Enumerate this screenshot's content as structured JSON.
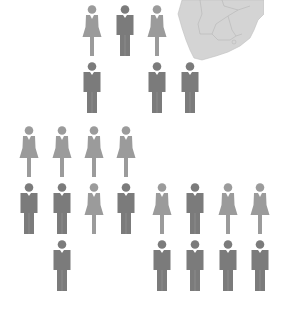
{
  "colors": {
    "female": "#9b9b9b",
    "male": "#7b7b7b",
    "map_fill": "#d4d4d4",
    "map_border": "#b5b5b5"
  },
  "map": {
    "region": "Southern Africa"
  },
  "groups": [
    {
      "name": "top-group",
      "figures": [
        {
          "gender": "female",
          "x": 82,
          "y": 5
        },
        {
          "gender": "male",
          "x": 115,
          "y": 5
        },
        {
          "gender": "female",
          "x": 147,
          "y": 5
        },
        {
          "gender": "male",
          "x": 82,
          "y": 62
        },
        {
          "gender": "male",
          "x": 147,
          "y": 62
        },
        {
          "gender": "male",
          "x": 180,
          "y": 62
        }
      ]
    },
    {
      "name": "left-group",
      "figures": [
        {
          "gender": "female",
          "x": 19,
          "y": 126
        },
        {
          "gender": "female",
          "x": 52,
          "y": 126
        },
        {
          "gender": "female",
          "x": 84,
          "y": 126
        },
        {
          "gender": "female",
          "x": 116,
          "y": 126
        },
        {
          "gender": "male",
          "x": 19,
          "y": 183
        },
        {
          "gender": "male",
          "x": 52,
          "y": 183
        },
        {
          "gender": "female",
          "x": 84,
          "y": 183
        },
        {
          "gender": "male",
          "x": 116,
          "y": 183
        },
        {
          "gender": "male",
          "x": 52,
          "y": 240
        }
      ]
    },
    {
      "name": "right-group",
      "figures": [
        {
          "gender": "female",
          "x": 152,
          "y": 183
        },
        {
          "gender": "male",
          "x": 185,
          "y": 183
        },
        {
          "gender": "female",
          "x": 218,
          "y": 183
        },
        {
          "gender": "female",
          "x": 250,
          "y": 183
        },
        {
          "gender": "male",
          "x": 152,
          "y": 240
        },
        {
          "gender": "male",
          "x": 185,
          "y": 240
        },
        {
          "gender": "male",
          "x": 218,
          "y": 240
        },
        {
          "gender": "male",
          "x": 250,
          "y": 240
        }
      ]
    }
  ],
  "counts": {
    "top-group": {
      "female": 2,
      "male": 4
    },
    "left-group": {
      "female": 5,
      "male": 4
    },
    "right-group": {
      "female": 3,
      "male": 5
    }
  }
}
